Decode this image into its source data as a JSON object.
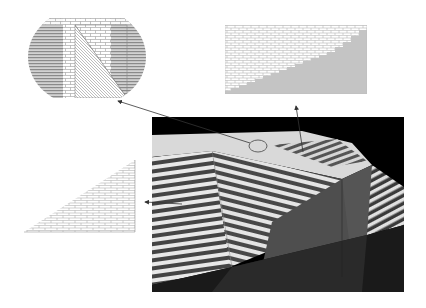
{
  "figure": {
    "background": "#ffffff",
    "panels": [
      {
        "id": "texture-panel-ellipse",
        "description": "Ellipse-clipped texture swatch: horizontal stripes, brick pattern, diagonal hatching triangle",
        "x": 28,
        "y": 15,
        "width": 118,
        "height": 84,
        "colors": {
          "stripe": "#8a8a8a",
          "stripe_bg": "#cfcfcf",
          "brick_line": "#9a9a9a",
          "brick_bg": "#ffffff",
          "hatch": "#777777"
        }
      },
      {
        "id": "texture-panel-rectangle",
        "description": "Rectangular texture swatch: brick upper-left, gray lower-right with stepped diagonal",
        "x": 225,
        "y": 25,
        "width": 142,
        "height": 69,
        "colors": {
          "brick_line": "#a8a8a8",
          "brick_bg": "#ffffff",
          "fill": "#c4c4c4"
        }
      },
      {
        "id": "texture-panel-triangle",
        "description": "Right-triangle brick texture swatch",
        "x": 24,
        "y": 160,
        "width": 112,
        "height": 73,
        "colors": {
          "brick_line": "#a0a0a0",
          "brick_bg": "#ffffff"
        }
      },
      {
        "id": "rendered-scene",
        "description": "3D rendered scene with striped shadow planes and dark box on black background",
        "x": 152,
        "y": 117,
        "width": 252,
        "height": 175,
        "colors": {
          "background": "#000000",
          "light_plane": "#d9d9d9",
          "stripe_light": "#e6e6e6",
          "stripe_dark": "#4a4a4a",
          "box_face": "#555555",
          "box_shadow": "#1e1e1e"
        }
      }
    ],
    "arrows": [
      {
        "id": "arrow-to-ellipse",
        "from": [
          258,
          146
        ],
        "to": [
          118,
          100
        ],
        "color": "#333333"
      },
      {
        "id": "arrow-to-rectangle",
        "from": [
          302,
          152
        ],
        "to": [
          296,
          105
        ],
        "color": "#333333"
      },
      {
        "id": "arrow-to-triangle",
        "from": [
          182,
          204
        ],
        "to": [
          145,
          202
        ],
        "color": "#333333"
      }
    ],
    "marker_ellipse": {
      "cx": 258,
      "cy": 146,
      "rx": 9,
      "ry": 6
    }
  }
}
